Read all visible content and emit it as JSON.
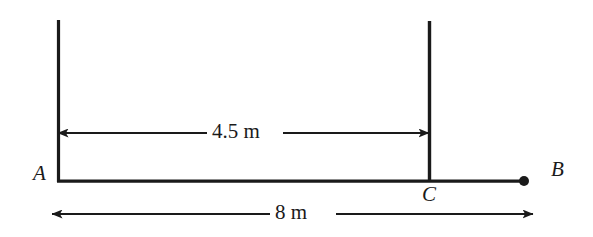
{
  "figure": {
    "type": "beam-dimension-diagram",
    "background_color": "#ffffff",
    "line_color": "#1a1a1a",
    "width": 593,
    "height": 237
  },
  "points": [
    {
      "id": "A",
      "label": "A",
      "x": 58,
      "y": 181,
      "marker": "none"
    },
    {
      "id": "C",
      "label": "C",
      "x": 429,
      "y": 181,
      "marker": "none"
    },
    {
      "id": "B",
      "label": "B",
      "x": 524,
      "y": 181,
      "marker": "filled-dot"
    }
  ],
  "segments": {
    "beam": {
      "name": "beam-line",
      "x1": 58,
      "y1": 181,
      "x2": 533,
      "y2": 181
    },
    "vertical_a": {
      "name": "vertical-line-a",
      "x1": 58,
      "y1": 20,
      "x2": 58,
      "y2": 181
    },
    "vertical_c": {
      "name": "vertical-line-c",
      "x1": 429,
      "y1": 21,
      "x2": 429,
      "y2": 181
    }
  },
  "dimensions": [
    {
      "id": "ac",
      "label": "4.5 m",
      "value": 4.5,
      "unit": "m",
      "from": "A",
      "to": "C",
      "y": 133,
      "x1": 58,
      "x2": 429,
      "arrows": "both"
    },
    {
      "id": "ab",
      "label": "8 m",
      "value": 8,
      "unit": "m",
      "from": "A",
      "to": "B",
      "y": 214,
      "x1": 52,
      "x2": 533,
      "arrows": "both"
    }
  ]
}
